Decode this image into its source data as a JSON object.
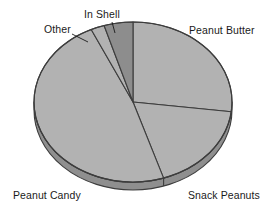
{
  "chart_data": {
    "type": "pie",
    "title": "",
    "subtitle": "",
    "xlabel": "",
    "ylabel": "",
    "legend_position": "none",
    "grid": false,
    "labels_placement": "outside-with-leader-lines",
    "three_d": true,
    "categories": [
      "Peanut Butter",
      "Snack Peanuts",
      "Peanut Candy",
      "Other",
      "In Shell"
    ],
    "values": [
      27,
      18,
      48,
      2,
      5
    ],
    "units": "percent",
    "slices": [
      {
        "label": "Peanut Butter",
        "value": 27,
        "start_angle_deg": 0,
        "end_angle_deg": 97,
        "color": "#b2b2b2",
        "highlighted": false
      },
      {
        "label": "Snack Peanuts",
        "value": 18,
        "start_angle_deg": 97,
        "end_angle_deg": 162,
        "color": "#b2b2b2",
        "highlighted": false
      },
      {
        "label": "Peanut Candy",
        "value": 48,
        "start_angle_deg": 162,
        "end_angle_deg": 335,
        "color": "#b2b2b2",
        "highlighted": false
      },
      {
        "label": "Other",
        "value": 2,
        "start_angle_deg": 335,
        "end_angle_deg": 343,
        "color": "#b2b2b2",
        "highlighted": false
      },
      {
        "label": "In Shell",
        "value": 5,
        "start_angle_deg": 343,
        "end_angle_deg": 360,
        "color": "#8d8d8d",
        "highlighted": true
      }
    ],
    "colors": {
      "slice_fill": "#b2b2b2",
      "slice_fill_dark": "#8d8d8d",
      "side_fill": "#8f8f8f",
      "side_fill_dark": "#6f6f6f",
      "outline": "#3d3d3d",
      "background": "#ffffff",
      "label_text": "#1a1a1a"
    }
  },
  "labels": {
    "peanut_butter": "Peanut Butter",
    "snack_peanuts": "Snack Peanuts",
    "peanut_candy": "Peanut Candy",
    "other": "Other",
    "in_shell": "In Shell"
  }
}
